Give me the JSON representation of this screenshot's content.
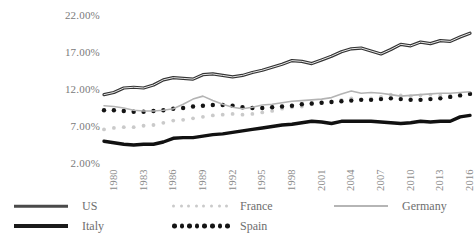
{
  "chart_data": {
    "type": "line",
    "title": "",
    "xlabel": "",
    "ylabel": "",
    "grid": false,
    "legend_position": "bottom",
    "ylim": [
      2,
      22
    ],
    "ytick_labels": [
      "22.00%",
      "17.00%",
      "12.00%",
      "7.00%",
      "2.00%"
    ],
    "ytick_values": [
      22,
      17,
      12,
      7,
      2
    ],
    "xtick_labels": [
      "1980",
      "1983",
      "1986",
      "1989",
      "1992",
      "1995",
      "1998",
      "2001",
      "2004",
      "2007",
      "2010",
      "2013",
      "2016"
    ],
    "x": [
      1980,
      1981,
      1982,
      1983,
      1984,
      1985,
      1986,
      1987,
      1988,
      1989,
      1990,
      1991,
      1992,
      1993,
      1994,
      1995,
      1996,
      1997,
      1998,
      1999,
      2000,
      2001,
      2002,
      2003,
      2004,
      2005,
      2006,
      2007,
      2008,
      2009,
      2010,
      2011,
      2012,
      2013,
      2014,
      2015,
      2016,
      2017
    ],
    "series": [
      {
        "name": "US",
        "style": "solid-dark",
        "color": "#3a3a3a",
        "values": [
          11.1,
          11.4,
          12.0,
          12.1,
          12.0,
          12.4,
          13.1,
          13.4,
          13.3,
          13.2,
          13.8,
          13.9,
          13.7,
          13.5,
          13.7,
          14.1,
          14.4,
          14.8,
          15.2,
          15.7,
          15.6,
          15.3,
          15.8,
          16.3,
          16.9,
          17.3,
          17.4,
          17.0,
          16.6,
          17.2,
          17.9,
          17.7,
          18.2,
          18.0,
          18.4,
          18.3,
          18.9,
          19.4
        ]
      },
      {
        "name": "Italy",
        "style": "solid-thick-black",
        "color": "#1a1a1a",
        "values": [
          4.8,
          4.6,
          4.4,
          4.3,
          4.4,
          4.4,
          4.7,
          5.2,
          5.3,
          5.3,
          5.5,
          5.7,
          5.8,
          6.0,
          6.2,
          6.4,
          6.6,
          6.8,
          7.0,
          7.1,
          7.3,
          7.5,
          7.4,
          7.2,
          7.5,
          7.5,
          7.5,
          7.5,
          7.4,
          7.3,
          7.2,
          7.3,
          7.5,
          7.4,
          7.5,
          7.5,
          8.1,
          8.3
        ]
      },
      {
        "name": "France",
        "style": "dotted-light",
        "color": "#c0c0c0",
        "values": [
          6.4,
          6.6,
          6.7,
          6.7,
          6.9,
          7.0,
          7.3,
          7.6,
          7.7,
          7.9,
          8.1,
          8.3,
          8.4,
          8.5,
          8.4,
          8.5,
          8.7,
          8.9,
          9.2,
          9.4,
          9.5,
          9.8,
          10.0,
          10.2,
          10.4,
          10.6,
          10.5,
          10.6,
          10.8,
          11.1,
          11.0,
          10.9,
          11.0,
          11.1,
          11.0,
          11.0,
          11.1,
          11.3
        ]
      },
      {
        "name": "Spain",
        "style": "dotted-black",
        "color": "#1a1a1a",
        "values": [
          9.0,
          9.0,
          8.9,
          8.8,
          8.8,
          8.9,
          9.0,
          9.2,
          9.3,
          9.5,
          9.6,
          9.7,
          9.7,
          9.6,
          9.4,
          9.3,
          9.3,
          9.4,
          9.5,
          9.6,
          9.8,
          9.9,
          10.0,
          10.1,
          10.2,
          10.3,
          10.4,
          10.4,
          10.5,
          10.6,
          10.5,
          10.4,
          10.4,
          10.5,
          10.6,
          10.8,
          11.0,
          11.2
        ]
      },
      {
        "name": "Germany",
        "style": "solid-light",
        "color": "#b0b0b0",
        "values": [
          9.6,
          9.5,
          9.3,
          9.0,
          8.9,
          8.9,
          9.0,
          9.2,
          9.8,
          10.5,
          10.9,
          10.3,
          9.8,
          9.4,
          9.2,
          9.4,
          9.7,
          9.8,
          10.0,
          10.2,
          10.3,
          10.4,
          10.5,
          10.7,
          11.2,
          11.6,
          11.3,
          11.4,
          11.3,
          11.1,
          10.9,
          11.0,
          11.1,
          11.2,
          11.3,
          11.3,
          11.4,
          11.5
        ]
      }
    ]
  },
  "legend": {
    "entries": [
      {
        "label": "US",
        "key": "solid-dark-line"
      },
      {
        "label": "France",
        "key": "dotted-light-line"
      },
      {
        "label": "Germany",
        "key": "solid-light-line"
      },
      {
        "label": "Italy",
        "key": "solid-thick-black-line"
      },
      {
        "label": "Spain",
        "key": "dotted-black-line"
      }
    ]
  },
  "colors": {
    "us": "#3a3a3a",
    "italy": "#1a1a1a",
    "france": "#c0c0c0",
    "spain": "#1a1a1a",
    "germany": "#b0b0b0",
    "text": "#7a7a7a",
    "background": "#ffffff"
  }
}
